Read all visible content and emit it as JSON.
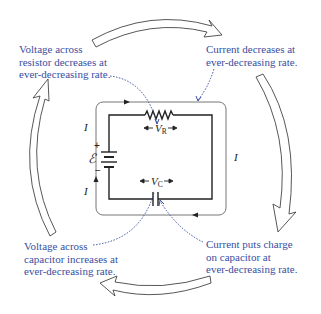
{
  "diagram": {
    "type": "rc-circuit-discharge-cycle",
    "captions": {
      "top_left": [
        "Voltage across",
        "resistor decreases at",
        "ever-decreasing rate."
      ],
      "top_right": [
        "Current decreases at",
        "ever-decreasing rate."
      ],
      "bottom_left": [
        "Voltage across",
        "capacitor increases at",
        "ever-decreasing rate."
      ],
      "bottom_right": [
        "Current puts charge",
        "on capacitor at",
        "ever-decreasing rate."
      ]
    },
    "circuit_labels": {
      "current_left_top": "I",
      "current_left_bottom": "I",
      "current_right": "I",
      "emf": "ℰ",
      "emf_plus": "+",
      "emf_minus": "−",
      "vr": "V",
      "vr_sub": "R",
      "vc": "V",
      "vc_sub": "C"
    },
    "colors": {
      "caption": "#3a4ea0",
      "wire": "#222222",
      "outer_loop": "#555555",
      "dotted_leader": "#3a4ea0",
      "cycle_arrow_stroke": "#444444"
    }
  }
}
